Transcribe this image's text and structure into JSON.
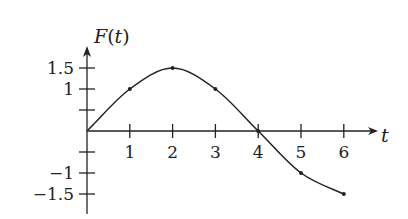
{
  "chart_data": {
    "type": "line",
    "title": "",
    "xlabel": "t",
    "ylabel": "F(t)",
    "ylabel_parts": {
      "name": "F",
      "open": "(",
      "var": "t",
      "close": ")"
    },
    "xlim": [
      0,
      6.8
    ],
    "ylim": [
      -1.9,
      2.0
    ],
    "grid": false,
    "legend": null,
    "x_ticks": [
      1,
      2,
      3,
      4,
      5,
      6
    ],
    "x_tick_labels": [
      "1",
      "2",
      "3",
      "4",
      "5",
      "6"
    ],
    "y_ticks": [
      1.5,
      1,
      0.5,
      -0.5,
      -1,
      -1.5
    ],
    "y_tick_labels": [
      "1.5",
      "1",
      "",
      "",
      "−1",
      "−1.5"
    ],
    "series": [
      {
        "name": "F(t)",
        "x": [
          0,
          1,
          2,
          3,
          4,
          5,
          6
        ],
        "y": [
          0,
          1,
          1.5,
          1,
          0,
          -1,
          -1.5
        ],
        "marked_points": [
          [
            1,
            1
          ],
          [
            2,
            1.5
          ],
          [
            3,
            1
          ],
          [
            4,
            0
          ],
          [
            5,
            -1
          ],
          [
            6,
            -1.5
          ]
        ]
      }
    ]
  }
}
